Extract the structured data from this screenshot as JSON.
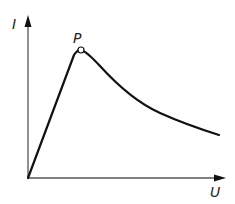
{
  "diagram": {
    "type": "I-U characteristic curve",
    "y_axis_label": "I",
    "x_axis_label": "U",
    "peak_label": "P",
    "colors": {
      "axis": "#555555",
      "curve": "#111111",
      "background": "#ffffff"
    },
    "points": {
      "origin": [
        28,
        178
      ],
      "peak": [
        81,
        50
      ]
    },
    "curve_description": "Linear rise from origin to peak P, then decaying curve toward lower-right"
  }
}
